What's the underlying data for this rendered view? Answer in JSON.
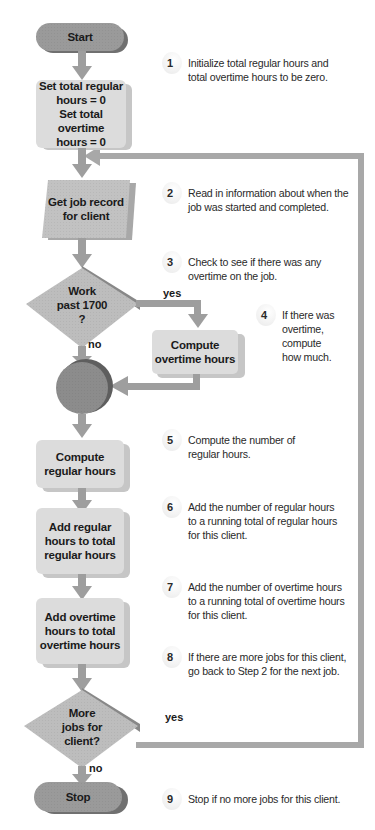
{
  "diagram": {
    "type": "flowchart",
    "nodes": [
      {
        "id": "start",
        "shape": "terminator",
        "text": "Start"
      },
      {
        "id": "init",
        "shape": "process",
        "text_lines": [
          "Set total regular",
          "hours = 0",
          "Set total overtime",
          "hours = 0"
        ]
      },
      {
        "id": "get_job",
        "shape": "input-output",
        "text_lines": [
          "Get job record",
          "for client"
        ]
      },
      {
        "id": "work_past",
        "shape": "decision",
        "text_lines": [
          "Work",
          "past 1700",
          "?"
        ]
      },
      {
        "id": "compute_ot",
        "shape": "process",
        "text_lines": [
          "Compute",
          "overtime hours"
        ]
      },
      {
        "id": "connector",
        "shape": "connector",
        "text": ""
      },
      {
        "id": "compute_reg",
        "shape": "process",
        "text_lines": [
          "Compute",
          "regular hours"
        ]
      },
      {
        "id": "add_reg",
        "shape": "process",
        "text_lines": [
          "Add regular",
          "hours to total",
          "regular hours"
        ]
      },
      {
        "id": "add_ot",
        "shape": "process",
        "text_lines": [
          "Add overtime",
          "hours to total",
          "overtime hours"
        ]
      },
      {
        "id": "more_jobs",
        "shape": "decision",
        "text_lines": [
          "More",
          "jobs for",
          "client?"
        ]
      },
      {
        "id": "stop",
        "shape": "terminator",
        "text": "Stop"
      }
    ],
    "edge_labels": {
      "work_past_yes": "yes",
      "work_past_no": "no",
      "more_jobs_yes": "yes",
      "more_jobs_no": "no"
    },
    "edges": [
      {
        "from": "start",
        "to": "init"
      },
      {
        "from": "init",
        "to": "get_job"
      },
      {
        "from": "get_job",
        "to": "work_past"
      },
      {
        "from": "work_past",
        "to": "compute_ot",
        "label": "yes"
      },
      {
        "from": "work_past",
        "to": "connector",
        "label": "no"
      },
      {
        "from": "compute_ot",
        "to": "connector"
      },
      {
        "from": "connector",
        "to": "compute_reg"
      },
      {
        "from": "compute_reg",
        "to": "add_reg"
      },
      {
        "from": "add_reg",
        "to": "add_ot"
      },
      {
        "from": "add_ot",
        "to": "more_jobs"
      },
      {
        "from": "more_jobs",
        "to": "get_job",
        "label": "yes"
      },
      {
        "from": "more_jobs",
        "to": "stop",
        "label": "no"
      }
    ],
    "steps": [
      {
        "num": "1",
        "lines": [
          "Initialize total regular hours and",
          "total overtime hours to be zero."
        ]
      },
      {
        "num": "2",
        "lines": [
          "Read in information about when the",
          "job was started and completed."
        ]
      },
      {
        "num": "3",
        "lines": [
          "Check to see if there was any",
          "overtime on the job."
        ]
      },
      {
        "num": "4",
        "lines": [
          "If there was",
          "overtime,",
          "compute",
          "how much."
        ]
      },
      {
        "num": "5",
        "lines": [
          "Compute the number of",
          "regular hours."
        ]
      },
      {
        "num": "6",
        "lines": [
          "Add the number of regular hours",
          "to a running total of regular hours",
          "for this client."
        ]
      },
      {
        "num": "7",
        "lines": [
          "Add the number of overtime hours",
          "to a running total of overtime hours",
          "for this client."
        ]
      },
      {
        "num": "8",
        "lines": [
          "If there are more jobs for this client,",
          "go back to Step 2 for the next job."
        ]
      },
      {
        "num": "9",
        "lines": [
          "Stop if no more jobs for this client."
        ]
      }
    ],
    "colors": {
      "terminator": "#9a9a9a",
      "process": "#dcdcdc",
      "io": "#c2c2c2",
      "decision": "#bdbdbd",
      "connector": "#8c8c8c",
      "arrow": "#9e9e9e",
      "loop_line": "#a8a8a8"
    }
  }
}
